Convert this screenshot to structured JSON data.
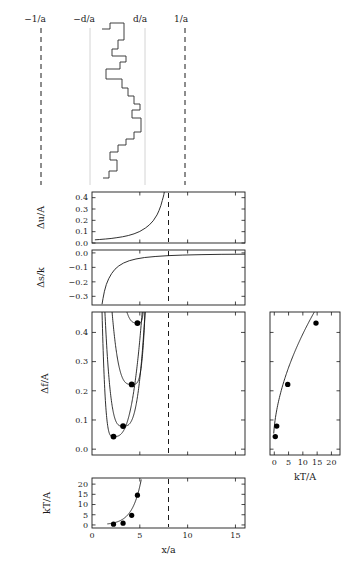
{
  "figure": {
    "title": "",
    "background": "#ffffff",
    "ink": "#1a1a1a",
    "faint_line_color": "#cfcfcf"
  },
  "top_panel": {
    "name": "step-profile",
    "labels": [
      {
        "text": "−1/a",
        "x_px": 35
      },
      {
        "text": "−d/a",
        "x_px": 84
      },
      {
        "text": "d/a",
        "x_px": 140
      },
      {
        "text": "1/a",
        "x_px": 181
      }
    ],
    "vertical_lines": [
      {
        "x_px": 41,
        "style": "dashed"
      },
      {
        "x_px": 90,
        "style": "faint"
      },
      {
        "x_px": 145,
        "style": "faint"
      },
      {
        "x_px": 185,
        "style": "dashed"
      }
    ],
    "staircase_points": [
      [
        102,
        29
      ],
      [
        110,
        29
      ],
      [
        110,
        23
      ],
      [
        124,
        23
      ],
      [
        124,
        40
      ],
      [
        118,
        40
      ],
      [
        118,
        49
      ],
      [
        112,
        49
      ],
      [
        112,
        56
      ],
      [
        126,
        56
      ],
      [
        126,
        62
      ],
      [
        120,
        62
      ],
      [
        120,
        69
      ],
      [
        106,
        69
      ],
      [
        106,
        79
      ],
      [
        122,
        79
      ],
      [
        122,
        88
      ],
      [
        128,
        88
      ],
      [
        128,
        96
      ],
      [
        134,
        96
      ],
      [
        134,
        104
      ],
      [
        140,
        104
      ],
      [
        140,
        110
      ],
      [
        132,
        110
      ],
      [
        132,
        118
      ],
      [
        141,
        118
      ],
      [
        141,
        132
      ],
      [
        134,
        132
      ],
      [
        134,
        139
      ],
      [
        126,
        139
      ],
      [
        126,
        145
      ],
      [
        118,
        145
      ],
      [
        118,
        152
      ],
      [
        110,
        152
      ],
      [
        110,
        160
      ],
      [
        117,
        160
      ],
      [
        117,
        171
      ],
      [
        109,
        171
      ],
      [
        109,
        178
      ],
      [
        103,
        178
      ]
    ]
  },
  "panels": [
    {
      "id": "du",
      "name": "delta-u-panel",
      "ylabel": "Δu/A",
      "yticks": [
        "0.4",
        "0.3",
        "0.2",
        "0.1",
        "0.0"
      ],
      "ytick_values": [
        0.4,
        0.3,
        0.2,
        0.1,
        0.0
      ],
      "ylim": [
        0.0,
        0.45
      ],
      "xlim": [
        0,
        16
      ],
      "xticks": [
        0,
        5,
        10,
        15
      ],
      "dashed_x": 8.0,
      "curve_note": "monotonic rise, diverges near x/a = 7.6"
    },
    {
      "id": "ds",
      "name": "delta-s-panel",
      "ylabel": "Δs/k",
      "yticks": [
        "0.0",
        "−0.1",
        "−0.2",
        "−0.3"
      ],
      "ytick_values": [
        0.0,
        -0.1,
        -0.2,
        -0.3
      ],
      "ylim": [
        -0.36,
        0.02
      ],
      "xlim": [
        0,
        16
      ],
      "xticks": [
        0,
        5,
        10,
        15
      ],
      "dashed_x": 8.0,
      "curve_note": "rises sharply from -0.35 toward 0"
    },
    {
      "id": "df",
      "name": "delta-f-panel",
      "ylabel": "Δf/A",
      "yticks": [
        "0.4",
        "0.3",
        "0.2",
        "0.1",
        "0.0"
      ],
      "ytick_values": [
        0.4,
        0.3,
        0.2,
        0.1,
        0.0
      ],
      "ylim": [
        -0.02,
        0.47
      ],
      "xlim": [
        0,
        16
      ],
      "xticks": [
        0,
        5,
        10,
        15
      ],
      "dashed_x": 8.0,
      "minima": [
        {
          "x": 2.25,
          "y": 0.043
        },
        {
          "x": 3.25,
          "y": 0.079
        },
        {
          "x": 4.15,
          "y": 0.222
        },
        {
          "x": 4.75,
          "y": 0.432
        }
      ]
    },
    {
      "id": "kt",
      "name": "kt-bottom-panel",
      "ylabel": "kT/A",
      "yticks": [
        "20",
        "15",
        "10",
        "5",
        "0"
      ],
      "ytick_values": [
        20,
        15,
        10,
        5,
        0
      ],
      "ylim": [
        -1.5,
        23
      ],
      "xlabel": "x/a",
      "xlim": [
        0,
        16
      ],
      "xticks": [
        "0",
        "5",
        "10",
        "15"
      ],
      "xtick_values": [
        0,
        5,
        10,
        15
      ],
      "dashed_x": 8.0,
      "points": [
        {
          "x": 2.25,
          "y": 0.35
        },
        {
          "x": 3.25,
          "y": 0.85
        },
        {
          "x": 4.15,
          "y": 4.7
        },
        {
          "x": 4.75,
          "y": 14.6
        }
      ]
    },
    {
      "id": "right",
      "name": "kt-right-panel",
      "xlabel": "kT/A",
      "xlim": [
        -1.5,
        23
      ],
      "xticks": [
        "0",
        "5",
        "10",
        "15",
        "20"
      ],
      "xtick_values": [
        0,
        5,
        10,
        15,
        20
      ],
      "ylim": [
        -0.02,
        0.47
      ],
      "ylabel": "",
      "points": [
        {
          "x": 0.35,
          "y": 0.043
        },
        {
          "x": 0.85,
          "y": 0.079
        },
        {
          "x": 4.7,
          "y": 0.222
        },
        {
          "x": 14.6,
          "y": 0.432
        }
      ]
    }
  ],
  "chart_data": {
    "type": "line",
    "title": "",
    "subtitle": "",
    "panels": [
      {
        "id": "step-profile",
        "type": "line",
        "title": "",
        "xlabel": "",
        "ylabel": "",
        "annotations": [
          "−1/a",
          "−d/a",
          "d/a",
          "1/a"
        ],
        "description": "Discrete staircase (step) interface profile drawn vertically between the d/a guide lines",
        "grid": false,
        "legend": "none"
      },
      {
        "id": "delta-u",
        "type": "line",
        "title": "",
        "xlabel": "x/a",
        "ylabel": "Δu/A",
        "xlim": [
          0,
          16
        ],
        "ylim": [
          0.0,
          0.45
        ],
        "xticks": [
          0,
          5,
          10,
          15
        ],
        "yticks": [
          0.0,
          0.1,
          0.2,
          0.3,
          0.4
        ],
        "grid": false,
        "legend": "none",
        "series": [
          {
            "name": "Δu/A",
            "x": [
              0.3,
              0.8,
              1.4,
              2.0,
              2.6,
              3.2,
              3.8,
              4.4,
              5.0,
              5.6,
              6.0,
              6.4,
              6.8,
              7.0,
              7.2,
              7.35,
              7.45,
              7.52,
              7.56
            ],
            "y": [
              0.028,
              0.031,
              0.035,
              0.04,
              0.047,
              0.055,
              0.066,
              0.081,
              0.102,
              0.133,
              0.16,
              0.196,
              0.248,
              0.285,
              0.33,
              0.375,
              0.405,
              0.43,
              0.45
            ]
          }
        ],
        "annotations": [
          "vertical dashed reference at x/a = 8"
        ]
      },
      {
        "id": "delta-s",
        "type": "line",
        "title": "",
        "xlabel": "x/a",
        "ylabel": "Δs/k",
        "xlim": [
          0,
          16
        ],
        "ylim": [
          -0.36,
          0.02
        ],
        "xticks": [
          0,
          5,
          10,
          15
        ],
        "yticks": [
          0.0,
          -0.1,
          -0.2,
          -0.3
        ],
        "grid": false,
        "legend": "none",
        "series": [
          {
            "name": "Δs/k",
            "x": [
              1.05,
              1.15,
              1.3,
              1.5,
              1.75,
              2.05,
              2.4,
              2.8,
              3.3,
              3.9,
              4.6,
              5.5,
              6.6,
              8.0,
              9.5,
              11.5,
              13.5,
              16.0
            ],
            "y": [
              -0.355,
              -0.315,
              -0.265,
              -0.218,
              -0.178,
              -0.143,
              -0.113,
              -0.09,
              -0.07,
              -0.054,
              -0.042,
              -0.032,
              -0.025,
              -0.019,
              -0.015,
              -0.012,
              -0.01,
              -0.009
            ]
          }
        ],
        "annotations": [
          "vertical dashed reference at x/a = 8"
        ]
      },
      {
        "id": "delta-f",
        "type": "line",
        "title": "",
        "xlabel": "x/a",
        "ylabel": "Δf/A",
        "xlim": [
          0,
          16
        ],
        "ylim": [
          -0.02,
          0.47
        ],
        "xticks": [
          0,
          5,
          10,
          15
        ],
        "yticks": [
          0.0,
          0.1,
          0.2,
          0.3,
          0.4
        ],
        "grid": false,
        "legend": "none",
        "series": [
          {
            "name": "curve-1",
            "minimum": {
              "x": 2.25,
              "y": 0.043
            }
          },
          {
            "name": "curve-2",
            "minimum": {
              "x": 3.25,
              "y": 0.079
            }
          },
          {
            "name": "curve-3",
            "minimum": {
              "x": 4.15,
              "y": 0.222
            }
          },
          {
            "name": "curve-4",
            "minimum": {
              "x": 4.75,
              "y": 0.432
            }
          }
        ],
        "markers": [
          {
            "x": 2.25,
            "y": 0.043
          },
          {
            "x": 3.25,
            "y": 0.079
          },
          {
            "x": 4.15,
            "y": 0.222
          },
          {
            "x": 4.75,
            "y": 0.432
          }
        ],
        "annotations": [
          "four free-energy curves, each with a filled-circle minimum",
          "vertical dashed reference at x/a = 8"
        ]
      },
      {
        "id": "kt-vs-x",
        "type": "scatter",
        "title": "",
        "xlabel": "x/a",
        "ylabel": "kT/A",
        "xlim": [
          0,
          16
        ],
        "ylim": [
          -1.5,
          23
        ],
        "xticks": [
          0,
          5,
          10,
          15
        ],
        "yticks": [
          0,
          5,
          10,
          15,
          20
        ],
        "grid": false,
        "legend": "none",
        "x": [
          2.25,
          3.25,
          4.15,
          4.75
        ],
        "y": [
          0.35,
          0.85,
          4.7,
          14.6
        ],
        "annotations": [
          "steeply rising connecting curve",
          "vertical dashed reference at x/a = 8"
        ]
      },
      {
        "id": "df-vs-kt",
        "type": "scatter",
        "title": "",
        "xlabel": "kT/A",
        "ylabel": "Δf/A",
        "xlim": [
          -1.5,
          23
        ],
        "ylim": [
          -0.02,
          0.47
        ],
        "xticks": [
          0,
          5,
          10,
          15,
          20
        ],
        "yticks": [
          0.0,
          0.1,
          0.2,
          0.3,
          0.4
        ],
        "grid": false,
        "legend": "none",
        "x": [
          0.35,
          0.85,
          4.7,
          14.6
        ],
        "y": [
          0.043,
          0.079,
          0.222,
          0.432
        ],
        "annotations": [
          "concave rising curve through the four minima"
        ]
      }
    ]
  }
}
